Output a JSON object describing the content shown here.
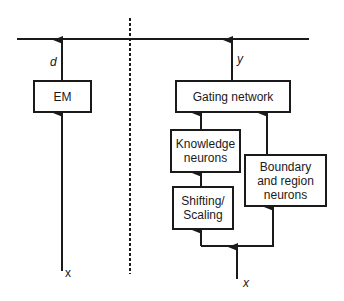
{
  "diagram": {
    "left_panel": {
      "box_label": "EM",
      "output_label": "d",
      "input_label": "x"
    },
    "right_panel": {
      "gating_label": "Gating network",
      "knowledge_label": "Knowledge neurons",
      "shifting_label": "Shifting/ Scaling",
      "boundary_label": "Boundary and region neurons",
      "output_label": "y",
      "input_label": "x"
    },
    "colors": {
      "stroke": "#1a1a1a",
      "background": "#ffffff"
    }
  }
}
